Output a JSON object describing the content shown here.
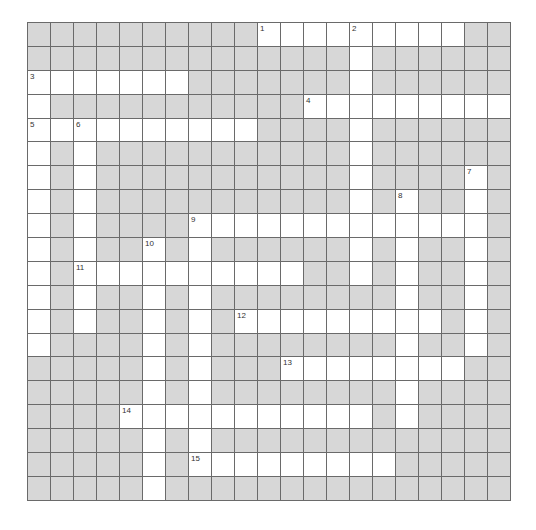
{
  "crossword": {
    "rows": 20,
    "cols": 21,
    "colors": {
      "block": "#d7d7d7",
      "open": "#ffffff",
      "line": "#6a6a6a"
    },
    "layout": [
      "##########.........##",
      "##############.######",
      ".......#######.######",
      ".###########.........",
      "..........####.######",
      ".#.###########.######",
      ".#.###########.####.#",
      ".#.###########.#.##.#",
      ".#.####.............#",
      ".#.##.#.######.#.##.#",
      ".#..........##.#.##.#",
      ".#.##.#.########.##.#",
      ".#.##.#.#.........#.#",
      ".####.#.########.##.#",
      "#####.#.###........##",
      "#####.#.########.####",
      "####...........#.####",
      "#####.#.#############",
      "#####.#.........#####",
      "#####.###############"
    ],
    "numbers": [
      {
        "n": "1",
        "row": 0,
        "col": 10
      },
      {
        "n": "2",
        "row": 0,
        "col": 14
      },
      {
        "n": "3",
        "row": 2,
        "col": 0
      },
      {
        "n": "4",
        "row": 3,
        "col": 12
      },
      {
        "n": "5",
        "row": 4,
        "col": 0
      },
      {
        "n": "6",
        "row": 4,
        "col": 2
      },
      {
        "n": "7",
        "row": 6,
        "col": 19
      },
      {
        "n": "8",
        "row": 7,
        "col": 16
      },
      {
        "n": "9",
        "row": 8,
        "col": 7
      },
      {
        "n": "10",
        "row": 9,
        "col": 5
      },
      {
        "n": "11",
        "row": 10,
        "col": 2
      },
      {
        "n": "12",
        "row": 12,
        "col": 9
      },
      {
        "n": "13",
        "row": 14,
        "col": 11
      },
      {
        "n": "14",
        "row": 16,
        "col": 4
      },
      {
        "n": "15",
        "row": 18,
        "col": 7
      }
    ]
  }
}
